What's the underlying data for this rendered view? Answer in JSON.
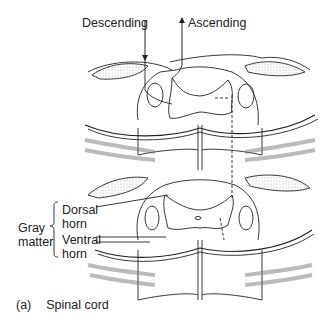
{
  "figure": {
    "caption_letter": "(a)",
    "caption_text": "Spinal cord",
    "labels": {
      "descending": "Descending",
      "ascending": "Ascending",
      "gray_matter_line1": "Gray",
      "gray_matter_line2": "matter",
      "dorsal_line1": "Dorsal",
      "dorsal_line2": "horn",
      "ventral_line1": "Ventral",
      "ventral_line2": "horn"
    },
    "colors": {
      "ink": "#222222",
      "stipple": "#bdbdbd",
      "background": "#ffffff"
    }
  }
}
